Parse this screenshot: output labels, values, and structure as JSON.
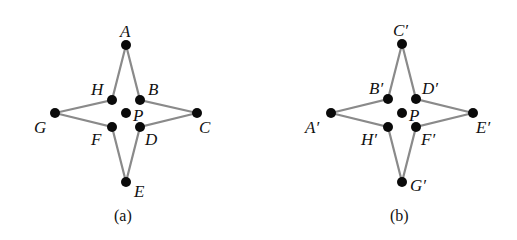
{
  "figures": [
    {
      "caption": "(a)",
      "center_label": "P",
      "points": {
        "A": "A",
        "B": "B",
        "C": "C",
        "D": "D",
        "E": "E",
        "F": "F",
        "G": "G",
        "H": "H"
      }
    },
    {
      "caption": "(b)",
      "center_label": "P",
      "points": {
        "C": "C′",
        "B": "B′",
        "D": "D′",
        "A": "A′",
        "E": "E′",
        "H": "H′",
        "F": "F′",
        "G": "G′"
      }
    }
  ],
  "colors": {
    "edge": "#8a8a8a",
    "point": "#0a0a0a"
  }
}
